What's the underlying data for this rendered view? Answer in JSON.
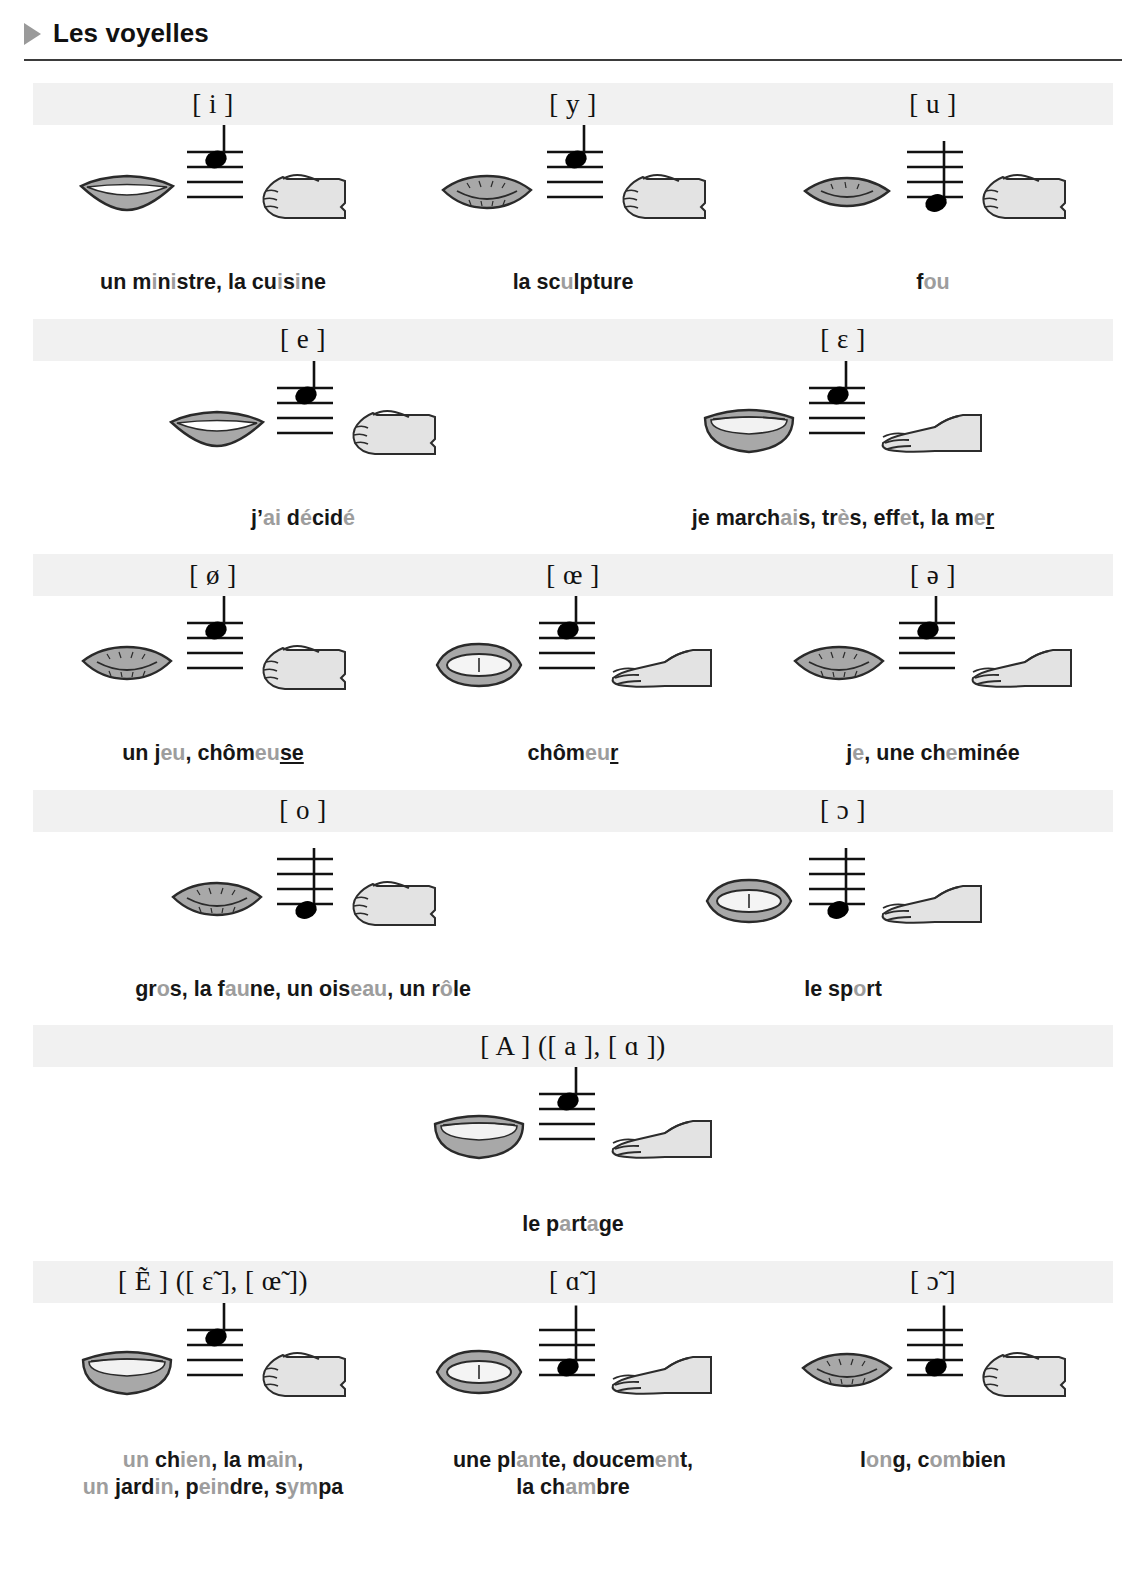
{
  "header": {
    "title": "Les voyelles",
    "bullet_icon": "triangle-right-icon"
  },
  "legend": {
    "mouth_icon": "mouth-shape-icon",
    "staff_icon": "musical-staff-icon",
    "hand_icon": "hand-gesture-icon"
  },
  "rows": [
    {
      "cells": [
        {
          "ipa": "[ i ]",
          "ipa_alt": "",
          "mouth": "spread-smile",
          "note_pos": 1,
          "hand": "fist",
          "example_lines": [
            [
              {
                "t": "un m",
                "hl": false
              },
              {
                "t": "i",
                "hl": true
              },
              {
                "t": "n",
                "hl": false
              },
              {
                "t": "i",
                "hl": true
              },
              {
                "t": "stre, la cu",
                "hl": false
              },
              {
                "t": "i",
                "hl": true
              },
              {
                "t": "s",
                "hl": false
              },
              {
                "t": "i",
                "hl": true
              },
              {
                "t": "ne",
                "hl": false
              }
            ]
          ],
          "example_text": "un ministre, la cuisine"
        },
        {
          "ipa": "[ y ]",
          "ipa_alt": "",
          "mouth": "rounded-small",
          "note_pos": 1,
          "hand": "fist",
          "example_lines": [
            [
              {
                "t": "la sc",
                "hl": false
              },
              {
                "t": "u",
                "hl": true
              },
              {
                "t": "lpture",
                "hl": false
              }
            ]
          ],
          "example_text": "la sculpture"
        },
        {
          "ipa": "[ u ]",
          "ipa_alt": "",
          "mouth": "rounded-tiny",
          "note_pos": 4,
          "hand": "fist",
          "example_lines": [
            [
              {
                "t": "f",
                "hl": false
              },
              {
                "t": "ou",
                "hl": true
              }
            ]
          ],
          "example_text": "fou"
        }
      ]
    },
    {
      "cells": [
        {
          "ipa": "[ e ]",
          "ipa_alt": "",
          "mouth": "spread-smile",
          "note_pos": 1,
          "hand": "fist",
          "example_lines": [
            [
              {
                "t": "j’",
                "hl": false
              },
              {
                "t": "ai",
                "hl": true
              },
              {
                "t": " d",
                "hl": false
              },
              {
                "t": "é",
                "hl": true
              },
              {
                "t": "cid",
                "hl": false
              },
              {
                "t": "é",
                "hl": true
              }
            ]
          ],
          "example_text": "j’ai décidé"
        },
        {
          "ipa": "[ ɛ ]",
          "ipa_alt": "",
          "mouth": "open-wide",
          "note_pos": 1,
          "hand": "open",
          "example_lines": [
            [
              {
                "t": "je march",
                "hl": false
              },
              {
                "t": "ai",
                "hl": true
              },
              {
                "t": "s, tr",
                "hl": false
              },
              {
                "t": "è",
                "hl": true
              },
              {
                "t": "s, eff",
                "hl": false
              },
              {
                "t": "e",
                "hl": true
              },
              {
                "t": "t, la m",
                "hl": false
              },
              {
                "t": "e",
                "hl": true
              },
              {
                "t": "r",
                "hl": false,
                "underline": true
              }
            ]
          ],
          "example_text": "je marchais, très, effet, la mer"
        }
      ]
    },
    {
      "cells": [
        {
          "ipa": "[ ø ]",
          "ipa_alt": "",
          "mouth": "rounded-small",
          "note_pos": 1,
          "hand": "fist",
          "example_lines": [
            [
              {
                "t": "un j",
                "hl": false
              },
              {
                "t": "eu",
                "hl": true
              },
              {
                "t": ", chôm",
                "hl": false
              },
              {
                "t": "eu",
                "hl": true
              },
              {
                "t": "se",
                "hl": false,
                "underline": true
              }
            ]
          ],
          "example_text": "un jeu, chômeuse"
        },
        {
          "ipa": "[ œ ]",
          "ipa_alt": "",
          "mouth": "round-open",
          "note_pos": 1,
          "hand": "open",
          "example_lines": [
            [
              {
                "t": "chôm",
                "hl": false
              },
              {
                "t": "eu",
                "hl": true
              },
              {
                "t": "r",
                "hl": false,
                "underline": true
              }
            ]
          ],
          "example_text": "chômeur"
        },
        {
          "ipa": "[ ə ]",
          "ipa_alt": "",
          "mouth": "rounded-small",
          "note_pos": 1,
          "hand": "open",
          "example_lines": [
            [
              {
                "t": "j",
                "hl": false
              },
              {
                "t": "e",
                "hl": true
              },
              {
                "t": ", une ch",
                "hl": false
              },
              {
                "t": "e",
                "hl": true
              },
              {
                "t": "minée",
                "hl": false
              }
            ]
          ],
          "example_text": "je, une cheminée"
        }
      ]
    },
    {
      "cells": [
        {
          "ipa": "[ o ]",
          "ipa_alt": "",
          "mouth": "rounded-small",
          "note_pos": 4,
          "hand": "fist",
          "example_lines": [
            [
              {
                "t": "gr",
                "hl": false
              },
              {
                "t": "o",
                "hl": true
              },
              {
                "t": "s, la f",
                "hl": false
              },
              {
                "t": "au",
                "hl": true
              },
              {
                "t": "ne, un ois",
                "hl": false
              },
              {
                "t": "eau",
                "hl": true
              },
              {
                "t": ", un r",
                "hl": false
              },
              {
                "t": "ô",
                "hl": true
              },
              {
                "t": "le",
                "hl": false
              }
            ]
          ],
          "example_text": "gros, la faune, un oiseau, un rôle"
        },
        {
          "ipa": "[ ɔ ]",
          "ipa_alt": "",
          "mouth": "round-open",
          "note_pos": 4,
          "hand": "open",
          "example_lines": [
            [
              {
                "t": "le sp",
                "hl": false
              },
              {
                "t": "o",
                "hl": true
              },
              {
                "t": "rt",
                "hl": false
              }
            ]
          ],
          "example_text": "le sport"
        }
      ]
    },
    {
      "cells": [
        {
          "ipa": "[ A ]",
          "ipa_alt": "([ a ], [ ɑ ])",
          "mouth": "open-wide",
          "note_pos": 1,
          "hand": "open",
          "example_lines": [
            [
              {
                "t": "le p",
                "hl": false
              },
              {
                "t": "a",
                "hl": true
              },
              {
                "t": "rt",
                "hl": false
              },
              {
                "t": "a",
                "hl": true
              },
              {
                "t": "ge",
                "hl": false
              }
            ]
          ],
          "example_text": "le partage"
        }
      ]
    },
    {
      "cells": [
        {
          "ipa": "[ Ẽ ]",
          "ipa_alt": "([ ɛ̃ ], [ œ̃ ])",
          "mouth": "open-wide",
          "note_pos": 1,
          "hand": "fist",
          "example_lines": [
            [
              {
                "t": "un",
                "hl": true
              },
              {
                "t": " ch",
                "hl": false
              },
              {
                "t": "ien",
                "hl": true
              },
              {
                "t": ", la m",
                "hl": false
              },
              {
                "t": "ain",
                "hl": true
              },
              {
                "t": ",",
                "hl": false
              }
            ],
            [
              {
                "t": "un",
                "hl": true
              },
              {
                "t": " jard",
                "hl": false
              },
              {
                "t": "in",
                "hl": true
              },
              {
                "t": ", p",
                "hl": false
              },
              {
                "t": "ein",
                "hl": true
              },
              {
                "t": "dre, s",
                "hl": false
              },
              {
                "t": "ym",
                "hl": true
              },
              {
                "t": "pa",
                "hl": false
              }
            ]
          ],
          "example_text": "un chien, la main, un jardin, peindre, sympa"
        },
        {
          "ipa": "[ ɑ̃ ]",
          "ipa_alt": "",
          "mouth": "round-open",
          "note_pos": 3,
          "hand": "open",
          "example_lines": [
            [
              {
                "t": "une pl",
                "hl": false
              },
              {
                "t": "an",
                "hl": true
              },
              {
                "t": "te, doucem",
                "hl": false
              },
              {
                "t": "en",
                "hl": true
              },
              {
                "t": "t,",
                "hl": false
              }
            ],
            [
              {
                "t": "la ch",
                "hl": false
              },
              {
                "t": "am",
                "hl": true
              },
              {
                "t": "bre",
                "hl": false
              }
            ]
          ],
          "example_text": "une plante, doucement, la chambre"
        },
        {
          "ipa": "[ ɔ̃ ]",
          "ipa_alt": "",
          "mouth": "rounded-small",
          "note_pos": 3,
          "hand": "fist",
          "example_lines": [
            [
              {
                "t": "l",
                "hl": false
              },
              {
                "t": "on",
                "hl": true
              },
              {
                "t": "g, c",
                "hl": false
              },
              {
                "t": "om",
                "hl": true
              },
              {
                "t": "bien",
                "hl": false
              }
            ]
          ],
          "example_text": "long, combien"
        }
      ]
    }
  ],
  "colors": {
    "band": "#f1f1f1",
    "highlight_text": "#9d9d9d",
    "body_text": "#161616",
    "rule": "#3b3b3b",
    "bullet": "#9a9a9a",
    "mouth_fill": "#a8a8a8",
    "hand_fill": "#e3e3e3",
    "note": "#000000"
  }
}
